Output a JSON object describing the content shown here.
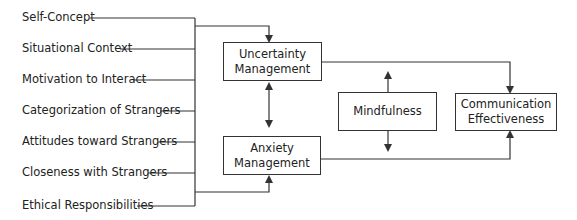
{
  "diagram": {
    "inputs": [
      {
        "label": "Self-Concept",
        "y": 18,
        "line_start": 90
      },
      {
        "label": "Situational Context",
        "y": 49,
        "line_start": 120
      },
      {
        "label": "Motivation to Interact",
        "y": 80,
        "line_start": 133
      },
      {
        "label": "Categorization of Strangers",
        "y": 111,
        "line_start": 160
      },
      {
        "label": "Attitudes toward Strangers",
        "y": 142,
        "line_start": 158
      },
      {
        "label": "Closeness with Strangers",
        "y": 173,
        "line_start": 148
      },
      {
        "label": "Ethical Responsibilities",
        "y": 206,
        "line_start": 137
      }
    ],
    "boxes": {
      "uncertainty": {
        "line1": "Uncertainty",
        "line2": "Management"
      },
      "anxiety": {
        "line1": "Anxiety",
        "line2": "Management"
      },
      "mindfulness": {
        "line1": "Mindfulness"
      },
      "communication": {
        "line1": "Communication",
        "line2": "Effectiveness"
      }
    },
    "colors": {
      "line": "#333333",
      "text": "#222222"
    }
  }
}
